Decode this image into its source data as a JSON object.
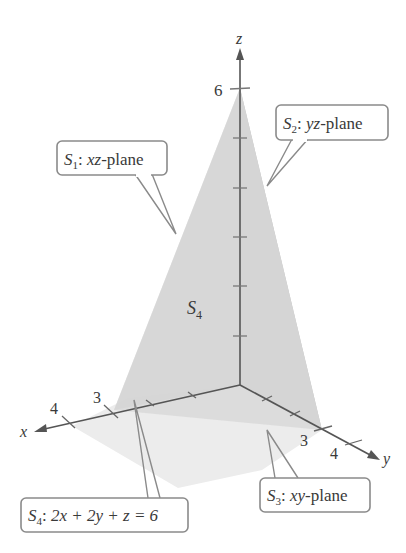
{
  "diagram": {
    "axes": {
      "x": {
        "label": "x",
        "ticks": [
          "3",
          "4"
        ]
      },
      "y": {
        "label": "y",
        "ticks": [
          "3",
          "4"
        ]
      },
      "z": {
        "label": "z",
        "ticks": [
          "6"
        ]
      }
    },
    "surface_label": {
      "name": "S",
      "sub": "4"
    },
    "callouts": [
      {
        "id": "s1",
        "name": "S",
        "sub": "1",
        "text": ": xz-plane",
        "var": "xz",
        "suffix": "-plane"
      },
      {
        "id": "s2",
        "name": "S",
        "sub": "2",
        "text": ": yz-plane",
        "var": "yz",
        "suffix": "-plane"
      },
      {
        "id": "s3",
        "name": "S",
        "sub": "3",
        "text": ": xy-plane",
        "var": "xy",
        "suffix": "-plane"
      },
      {
        "id": "s4",
        "name": "S",
        "sub": "4",
        "text": ": 2x + 2y + z = 6",
        "equation": "2x + 2y + z = 6"
      }
    ],
    "colors": {
      "front_face": "#d6d6d6",
      "side_face": "#b4b4b4",
      "base_face": "#e6e6e6",
      "axis": "#555555",
      "callout_border": "#8a8a8a",
      "text": "#3a3a3a"
    }
  }
}
